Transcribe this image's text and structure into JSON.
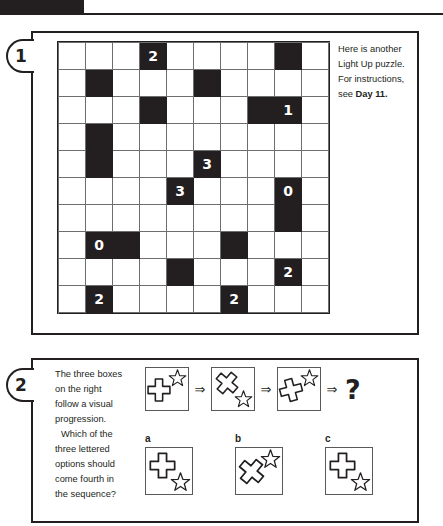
{
  "page": {
    "background": "#ffffff",
    "ink": "#231f20",
    "grid_line": "#6d6e71"
  },
  "header": {
    "tab_color": "#231f20",
    "rule_color": "#231f20"
  },
  "puzzle1": {
    "number": "1",
    "note_line1": "Here is another",
    "note_line2": "Light Up puzzle.",
    "note_line3": "For instructions,",
    "note_line4_prefix": "see ",
    "note_line4_bold": "Day 11.",
    "grid": {
      "type": "light-up",
      "rows": 10,
      "cols": 10,
      "cells": [
        [
          {
            "black": false,
            "value": ""
          },
          {
            "black": false,
            "value": ""
          },
          {
            "black": false,
            "value": ""
          },
          {
            "black": true,
            "value": "2"
          },
          {
            "black": false,
            "value": ""
          },
          {
            "black": false,
            "value": ""
          },
          {
            "black": false,
            "value": ""
          },
          {
            "black": false,
            "value": ""
          },
          {
            "black": true,
            "value": ""
          },
          {
            "black": false,
            "value": ""
          }
        ],
        [
          {
            "black": false,
            "value": ""
          },
          {
            "black": true,
            "value": ""
          },
          {
            "black": false,
            "value": ""
          },
          {
            "black": false,
            "value": ""
          },
          {
            "black": false,
            "value": ""
          },
          {
            "black": true,
            "value": ""
          },
          {
            "black": false,
            "value": ""
          },
          {
            "black": false,
            "value": ""
          },
          {
            "black": false,
            "value": ""
          },
          {
            "black": false,
            "value": ""
          }
        ],
        [
          {
            "black": false,
            "value": ""
          },
          {
            "black": false,
            "value": ""
          },
          {
            "black": false,
            "value": ""
          },
          {
            "black": true,
            "value": ""
          },
          {
            "black": false,
            "value": ""
          },
          {
            "black": false,
            "value": ""
          },
          {
            "black": false,
            "value": ""
          },
          {
            "black": true,
            "value": ""
          },
          {
            "black": true,
            "value": "1"
          },
          {
            "black": false,
            "value": ""
          }
        ],
        [
          {
            "black": false,
            "value": ""
          },
          {
            "black": true,
            "value": ""
          },
          {
            "black": false,
            "value": ""
          },
          {
            "black": false,
            "value": ""
          },
          {
            "black": false,
            "value": ""
          },
          {
            "black": false,
            "value": ""
          },
          {
            "black": false,
            "value": ""
          },
          {
            "black": false,
            "value": ""
          },
          {
            "black": false,
            "value": ""
          },
          {
            "black": false,
            "value": ""
          }
        ],
        [
          {
            "black": false,
            "value": ""
          },
          {
            "black": true,
            "value": ""
          },
          {
            "black": false,
            "value": ""
          },
          {
            "black": false,
            "value": ""
          },
          {
            "black": false,
            "value": ""
          },
          {
            "black": true,
            "value": "3"
          },
          {
            "black": false,
            "value": ""
          },
          {
            "black": false,
            "value": ""
          },
          {
            "black": false,
            "value": ""
          },
          {
            "black": false,
            "value": ""
          }
        ],
        [
          {
            "black": false,
            "value": ""
          },
          {
            "black": false,
            "value": ""
          },
          {
            "black": false,
            "value": ""
          },
          {
            "black": false,
            "value": ""
          },
          {
            "black": true,
            "value": "3"
          },
          {
            "black": false,
            "value": ""
          },
          {
            "black": false,
            "value": ""
          },
          {
            "black": false,
            "value": ""
          },
          {
            "black": true,
            "value": "0"
          },
          {
            "black": false,
            "value": ""
          }
        ],
        [
          {
            "black": false,
            "value": ""
          },
          {
            "black": false,
            "value": ""
          },
          {
            "black": false,
            "value": ""
          },
          {
            "black": false,
            "value": ""
          },
          {
            "black": false,
            "value": ""
          },
          {
            "black": false,
            "value": ""
          },
          {
            "black": false,
            "value": ""
          },
          {
            "black": false,
            "value": ""
          },
          {
            "black": true,
            "value": ""
          },
          {
            "black": false,
            "value": ""
          }
        ],
        [
          {
            "black": false,
            "value": ""
          },
          {
            "black": true,
            "value": "0"
          },
          {
            "black": true,
            "value": ""
          },
          {
            "black": false,
            "value": ""
          },
          {
            "black": false,
            "value": ""
          },
          {
            "black": false,
            "value": ""
          },
          {
            "black": true,
            "value": ""
          },
          {
            "black": false,
            "value": ""
          },
          {
            "black": false,
            "value": ""
          },
          {
            "black": false,
            "value": ""
          }
        ],
        [
          {
            "black": false,
            "value": ""
          },
          {
            "black": false,
            "value": ""
          },
          {
            "black": false,
            "value": ""
          },
          {
            "black": false,
            "value": ""
          },
          {
            "black": true,
            "value": ""
          },
          {
            "black": false,
            "value": ""
          },
          {
            "black": false,
            "value": ""
          },
          {
            "black": false,
            "value": ""
          },
          {
            "black": true,
            "value": "2"
          },
          {
            "black": false,
            "value": ""
          }
        ],
        [
          {
            "black": false,
            "value": ""
          },
          {
            "black": true,
            "value": "2"
          },
          {
            "black": false,
            "value": ""
          },
          {
            "black": false,
            "value": ""
          },
          {
            "black": false,
            "value": ""
          },
          {
            "black": false,
            "value": ""
          },
          {
            "black": true,
            "value": "2"
          },
          {
            "black": false,
            "value": ""
          },
          {
            "black": false,
            "value": ""
          },
          {
            "black": false,
            "value": ""
          }
        ]
      ]
    }
  },
  "puzzle2": {
    "number": "2",
    "note_line1": "The three boxes",
    "note_line2": "on the right",
    "note_line3": "follow a visual",
    "note_line4": "progression.",
    "note_line5": "Which of the",
    "note_line6": "three lettered",
    "note_line7": "options should",
    "note_line8": "come fourth in",
    "note_line9": "the sequence?",
    "arrow_glyph": "⇒",
    "question_glyph": "?",
    "sequence": [
      {
        "name": "sequence-box-1",
        "cross_rotation_deg": 0,
        "star_position": "top-right",
        "star_rotation_deg": 0
      },
      {
        "name": "sequence-box-2",
        "cross_rotation_deg": 40,
        "star_position": "bottom-right",
        "star_rotation_deg": 0
      },
      {
        "name": "sequence-box-3",
        "cross_rotation_deg": 75,
        "star_position": "top-right",
        "star_rotation_deg": 0
      }
    ],
    "options": [
      {
        "label": "a",
        "cross_rotation_deg": 0,
        "star_position": "bottom-right"
      },
      {
        "label": "b",
        "cross_rotation_deg": 40,
        "star_position": "top-right"
      },
      {
        "label": "c",
        "cross_rotation_deg": 0,
        "star_position": "bottom-right"
      }
    ]
  }
}
